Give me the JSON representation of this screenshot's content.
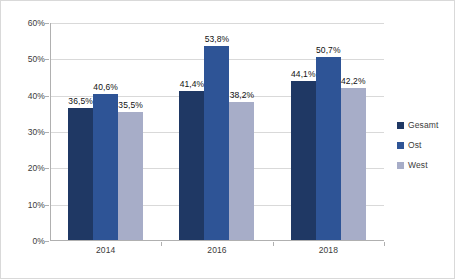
{
  "chart_data": {
    "type": "bar",
    "title": "",
    "subtitle": "",
    "xlabel": "",
    "ylabel": "",
    "categories": [
      "2014",
      "2016",
      "2018"
    ],
    "series": [
      {
        "name": "Gesamt",
        "color": "#1f3864",
        "values": [
          36.5,
          41.4,
          44.1
        ],
        "labels": [
          "36,5%",
          "41,4%",
          "44,1%"
        ]
      },
      {
        "name": "Ost",
        "color": "#2e5496",
        "values": [
          40.6,
          53.8,
          50.7
        ],
        "labels": [
          "40,6%",
          "53,8%",
          "50,7%"
        ]
      },
      {
        "name": "West",
        "color": "#a7adc8",
        "values": [
          35.5,
          38.2,
          42.2
        ],
        "labels": [
          "35,5%",
          "38,2%",
          "42,2%"
        ]
      }
    ],
    "ylim": [
      0,
      60
    ],
    "y_ticks": [
      0,
      10,
      20,
      30,
      40,
      50,
      60
    ],
    "y_tick_labels": [
      "0%",
      "10%",
      "20%",
      "30%",
      "40%",
      "50%",
      "60%"
    ],
    "grid": true,
    "grid_axis": "y",
    "legend_position": "right",
    "value_labels_shown": true,
    "colors": {
      "grid": "#d9d9d9",
      "axis": "#b0b0b0",
      "border": "#d9d9d9",
      "background": "#ffffff",
      "text": "#3b3b3b"
    }
  },
  "legend": {
    "items": [
      {
        "label": "Gesamt"
      },
      {
        "label": "Ost"
      },
      {
        "label": "West"
      }
    ]
  }
}
